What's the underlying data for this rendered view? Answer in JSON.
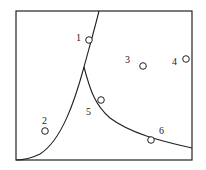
{
  "diagram": {
    "frame": {
      "x": 16,
      "y": 11,
      "width": 176,
      "height": 149
    },
    "colors": {
      "stroke": "#222222",
      "background": "#ffffff"
    },
    "points": [
      {
        "label": "1",
        "cx": 89,
        "cy": 40,
        "lx": 76,
        "ly": 41
      },
      {
        "label": "2",
        "cx": 45,
        "cy": 131,
        "lx": 42,
        "ly": 124
      },
      {
        "label": "3",
        "cx": 143,
        "cy": 66,
        "lx": 125,
        "ly": 63
      },
      {
        "label": "4",
        "cx": 186,
        "cy": 59,
        "lx": 172,
        "ly": 65
      },
      {
        "label": "5",
        "cx": 101,
        "cy": 100,
        "lx": 86,
        "ly": 115
      },
      {
        "label": "6",
        "cx": 151,
        "cy": 140,
        "lx": 159,
        "ly": 134
      }
    ],
    "curves": [
      {
        "name": "upper-boundary",
        "d": "M 99 11 C 93 35, 88 52, 84 67 C 75 100, 62 140, 40 154 C 30 159, 22 160, 16 160"
      },
      {
        "name": "lower-boundary",
        "d": "M 84 67 C 90 90, 95 105, 110 118 C 130 133, 160 141, 192 148"
      }
    ]
  }
}
